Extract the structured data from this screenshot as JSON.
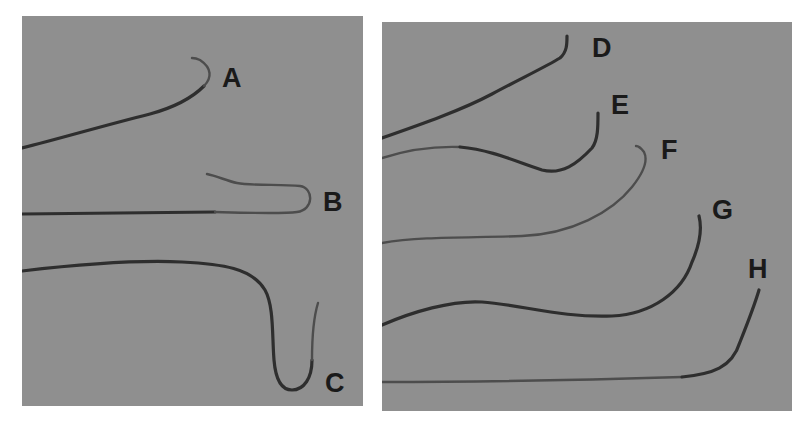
{
  "figure": {
    "panels": [
      {
        "id": "left",
        "specimens": [
          {
            "label": "A"
          },
          {
            "label": "B"
          },
          {
            "label": "C"
          }
        ]
      },
      {
        "id": "right",
        "specimens": [
          {
            "label": "D"
          },
          {
            "label": "E"
          },
          {
            "label": "F"
          },
          {
            "label": "G"
          },
          {
            "label": "H"
          }
        ]
      }
    ]
  }
}
